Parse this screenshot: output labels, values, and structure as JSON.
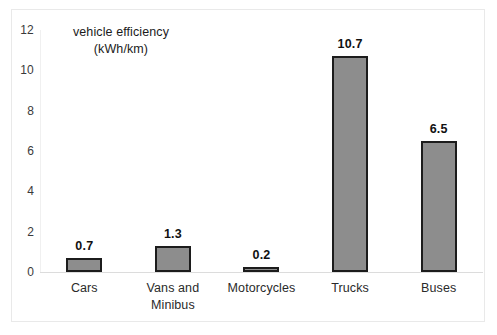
{
  "chart_data": {
    "type": "bar",
    "title": "vehicle efficiency (kWh/km)",
    "title_line1": "vehicle efficiency",
    "title_line2": "(kWh/km)",
    "categories": [
      "Cars",
      "Vans and Minibus",
      "Motorcycles",
      "Trucks",
      "Buses"
    ],
    "category_lines": [
      [
        "Cars"
      ],
      [
        "Vans and",
        "Minibus"
      ],
      [
        "Motorcycles"
      ],
      [
        "Trucks"
      ],
      [
        "Buses"
      ]
    ],
    "values": [
      0.7,
      1.3,
      0.2,
      10.7,
      6.5
    ],
    "value_labels": [
      "0.7",
      "1.3",
      "0.2",
      "10.7",
      "6.5"
    ],
    "xlabel": "",
    "ylabel": "",
    "ylim": [
      0,
      12
    ],
    "y_ticks": [
      0,
      2,
      4,
      6,
      8,
      10,
      12
    ],
    "y_tick_labels": [
      "0",
      "2",
      "4",
      "6",
      "8",
      "10",
      "12"
    ],
    "grid": false,
    "legend": false,
    "bar_fill_color": "#8d8d8d",
    "bar_border_color": "#1c1c1c",
    "background_color": "#ffffff",
    "axis_color": "#dcdcdc",
    "text_color": "#2a2a2a"
  }
}
